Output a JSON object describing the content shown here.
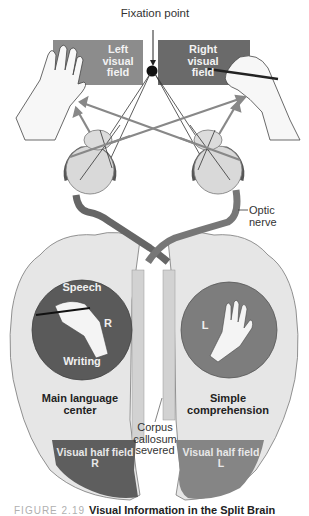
{
  "figure": {
    "title": "Visual Information in the Split Brain",
    "number_label": "FIGURE 2.19",
    "colors": {
      "background": "#ffffff",
      "right_field_panel": "#6a6a6a",
      "left_field_panel": "#8c8c8c",
      "left_hemisphere_circle": "#5a5a5a",
      "right_hemisphere_circle": "#7d7d7d",
      "brain_tissue": "#e6e6e6",
      "optic_nerve": "#6e6e6e",
      "vhf_right_region": "#5e5e5e",
      "vhf_left_region": "#858585"
    }
  },
  "labels": {
    "fixation_point": "Fixation point",
    "left_visual_field": [
      "Left",
      "visual",
      "field"
    ],
    "right_visual_field": [
      "Right",
      "visual",
      "field"
    ],
    "optic_nerve": [
      "Optic",
      "nerve"
    ],
    "speech": "Speech",
    "writing": "Writing",
    "right_hand_mark": "R",
    "left_hand_mark": "L",
    "main_language_center": [
      "Main language",
      "center"
    ],
    "simple_comprehension": [
      "Simple",
      "comprehension"
    ],
    "corpus_callosum": [
      "Corpus",
      "callosum",
      "severed"
    ],
    "visual_half_field_right": [
      "Visual half field",
      "R"
    ],
    "visual_half_field_left": [
      "Visual half field",
      "L"
    ]
  },
  "icons": {
    "left_hand": "open-hand-icon",
    "right_hand": "hand-holding-pen-icon",
    "fixation_dot": "fixation-dot-icon",
    "left_eye": "eyeball-icon",
    "right_eye": "eyeball-icon"
  }
}
